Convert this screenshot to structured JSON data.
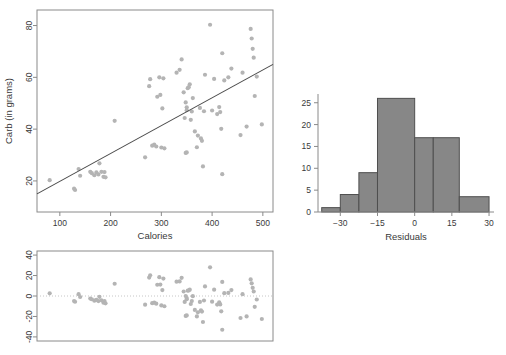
{
  "figure": {
    "name": "regression-diagnostics-figure",
    "panels": [
      "scatter-with-fit",
      "residual-plot",
      "residual-histogram"
    ]
  },
  "chart_data": [
    {
      "id": "scatter",
      "type": "scatter",
      "title": "",
      "xlabel": "Calories",
      "ylabel": "Carb (in grams)",
      "xlim": [
        55,
        520
      ],
      "ylim": [
        8,
        86
      ],
      "xticks": [
        100,
        200,
        300,
        400,
        500
      ],
      "yticks": [
        20,
        40,
        60,
        80
      ],
      "grid": false,
      "legend": "none",
      "fit_line": {
        "label": "least-squares line",
        "x": [
          55,
          520
        ],
        "y": [
          15.0,
          65.0
        ]
      },
      "points": [
        [
          80,
          20.3
        ],
        [
          128,
          17.0
        ],
        [
          130,
          16.5
        ],
        [
          137,
          24.6
        ],
        [
          140,
          22.0
        ],
        [
          160,
          23.5
        ],
        [
          163,
          23.0
        ],
        [
          168,
          22.2
        ],
        [
          172,
          23.3
        ],
        [
          176,
          22.5
        ],
        [
          178,
          26.8
        ],
        [
          182,
          23.5
        ],
        [
          186,
          21.6
        ],
        [
          188,
          23.4
        ],
        [
          190,
          21.4
        ],
        [
          208,
          43.2
        ],
        [
          268,
          29.1
        ],
        [
          276,
          56.6
        ],
        [
          278,
          59.3
        ],
        [
          282,
          33.6
        ],
        [
          286,
          34.0
        ],
        [
          290,
          33.3
        ],
        [
          292,
          52.5
        ],
        [
          296,
          60.0
        ],
        [
          298,
          53.2
        ],
        [
          300,
          32.9
        ],
        [
          302,
          48.0
        ],
        [
          304,
          59.6
        ],
        [
          306,
          32.6
        ],
        [
          330,
          61.8
        ],
        [
          336,
          62.9
        ],
        [
          340,
          66.9
        ],
        [
          344,
          54.2
        ],
        [
          346,
          44.3
        ],
        [
          348,
          50.3
        ],
        [
          348,
          30.8
        ],
        [
          350,
          48.4
        ],
        [
          350,
          47.3
        ],
        [
          350,
          31.0
        ],
        [
          352,
          55.8
        ],
        [
          354,
          56.2
        ],
        [
          356,
          57.3
        ],
        [
          358,
          43.6
        ],
        [
          360,
          46.8
        ],
        [
          362,
          52.0
        ],
        [
          366,
          39.1
        ],
        [
          370,
          33.0
        ],
        [
          372,
          37.5
        ],
        [
          376,
          48.2
        ],
        [
          378,
          36.4
        ],
        [
          380,
          35.5
        ],
        [
          382,
          25.6
        ],
        [
          384,
          46.9
        ],
        [
          386,
          61.0
        ],
        [
          396,
          80.3
        ],
        [
          400,
          47.2
        ],
        [
          404,
          59.4
        ],
        [
          410,
          45.8
        ],
        [
          414,
          48.5
        ],
        [
          416,
          46.6
        ],
        [
          418,
          40.1
        ],
        [
          420,
          69.3
        ],
        [
          420,
          22.6
        ],
        [
          424,
          58.8
        ],
        [
          432,
          60.0
        ],
        [
          438,
          63.4
        ],
        [
          456,
          37.7
        ],
        [
          460,
          61.8
        ],
        [
          468,
          41.0
        ],
        [
          476,
          78.7
        ],
        [
          478,
          75.0
        ],
        [
          480,
          71.0
        ],
        [
          482,
          67.6
        ],
        [
          484,
          52.8
        ],
        [
          488,
          60.3
        ],
        [
          498,
          41.8
        ]
      ]
    },
    {
      "id": "residuals-vs-calories",
      "type": "scatter",
      "title": "",
      "xlabel": "",
      "ylabel": "",
      "xlim": [
        55,
        520
      ],
      "ylim": [
        -44,
        44
      ],
      "xticks": [],
      "yticks": [
        -40,
        -20,
        0,
        20,
        40
      ],
      "grid": false,
      "legend": "none",
      "reference_line": {
        "label": "zero-line",
        "y": 0
      },
      "points": [
        [
          80,
          2.6
        ],
        [
          128,
          -5.0
        ],
        [
          130,
          -5.6
        ],
        [
          137,
          1.8
        ],
        [
          140,
          -1.0
        ],
        [
          160,
          -2.5
        ],
        [
          163,
          -3.2
        ],
        [
          168,
          -4.6
        ],
        [
          172,
          -3.8
        ],
        [
          176,
          -5.0
        ],
        [
          178,
          -0.8
        ],
        [
          182,
          -4.2
        ],
        [
          186,
          -6.6
        ],
        [
          188,
          -5.0
        ],
        [
          190,
          -7.2
        ],
        [
          208,
          12.0
        ],
        [
          268,
          -8.5
        ],
        [
          276,
          18.0
        ],
        [
          278,
          20.3
        ],
        [
          282,
          -7.0
        ],
        [
          286,
          -6.5
        ],
        [
          290,
          -7.5
        ],
        [
          292,
          11.0
        ],
        [
          296,
          18.4
        ],
        [
          298,
          11.2
        ],
        [
          300,
          -9.2
        ],
        [
          302,
          5.8
        ],
        [
          304,
          17.0
        ],
        [
          306,
          -10.0
        ],
        [
          330,
          14.0
        ],
        [
          336,
          14.3
        ],
        [
          340,
          17.8
        ],
        [
          344,
          4.4
        ],
        [
          346,
          -5.8
        ],
        [
          348,
          0.0
        ],
        [
          348,
          -19.5
        ],
        [
          350,
          -2.0
        ],
        [
          350,
          -3.2
        ],
        [
          350,
          -19.0
        ],
        [
          352,
          5.2
        ],
        [
          354,
          5.4
        ],
        [
          356,
          6.2
        ],
        [
          358,
          -7.8
        ],
        [
          360,
          -5.0
        ],
        [
          362,
          -0.2
        ],
        [
          366,
          -13.6
        ],
        [
          370,
          -20.0
        ],
        [
          372,
          -16.0
        ],
        [
          376,
          -5.8
        ],
        [
          378,
          -14.0
        ],
        [
          380,
          -15.2
        ],
        [
          382,
          -25.4
        ],
        [
          384,
          -4.4
        ],
        [
          386,
          9.4
        ],
        [
          396,
          28.0
        ],
        [
          400,
          -5.5
        ],
        [
          404,
          6.2
        ],
        [
          410,
          -8.4
        ],
        [
          414,
          -6.1
        ],
        [
          416,
          -8.2
        ],
        [
          418,
          -15.0
        ],
        [
          420,
          13.8
        ],
        [
          420,
          -33.0
        ],
        [
          424,
          2.8
        ],
        [
          432,
          3.0
        ],
        [
          438,
          5.8
        ],
        [
          456,
          -21.5
        ],
        [
          460,
          1.8
        ],
        [
          468,
          -20.0
        ],
        [
          476,
          16.2
        ],
        [
          478,
          12.4
        ],
        [
          480,
          8.0
        ],
        [
          482,
          4.4
        ],
        [
          484,
          -10.6
        ],
        [
          488,
          -3.4
        ],
        [
          498,
          -22.5
        ]
      ]
    },
    {
      "id": "residual-histogram",
      "type": "bar",
      "title": "",
      "xlabel": "Residuals",
      "ylabel": "",
      "xlim": [
        -39,
        32
      ],
      "ylim": [
        0,
        27
      ],
      "xticks": [
        -30,
        -15,
        0,
        15,
        30
      ],
      "yticks": [
        0,
        5,
        10,
        15,
        20,
        25
      ],
      "grid": false,
      "legend": "none",
      "bin_edges": [
        -37.5,
        -30,
        -22.5,
        -15,
        -7.5,
        0,
        7.5,
        15,
        22.5,
        30
      ],
      "bins": [
        {
          "from": -37.5,
          "to": -30.0,
          "count": 1
        },
        {
          "from": -30.0,
          "to": -22.5,
          "count": 4
        },
        {
          "from": -22.5,
          "to": -15.0,
          "count": 9
        },
        {
          "from": -15.0,
          "to": 0.0,
          "count": 26
        },
        {
          "from": 0.0,
          "to": 7.5,
          "count": 17
        },
        {
          "from": 7.5,
          "to": 18.0,
          "count": 17
        },
        {
          "from": 18.0,
          "to": 30.0,
          "count": 3.5
        }
      ],
      "categories": [
        "-37.5..-30",
        "-30..-22.5",
        "-22.5..-15",
        "-15..0",
        "0..7.5",
        "7.5..18",
        "18..30"
      ],
      "values": [
        1,
        4,
        9,
        26,
        17,
        17,
        3.5
      ]
    }
  ],
  "colors": {
    "point": "#b4b4b4",
    "fit_line": "#4a4a4a",
    "bar_fill": "#878787",
    "bar_edge": "#4f4f4f",
    "axis": "#8a8a8a",
    "text": "#3a3a3a",
    "background": "#ffffff"
  },
  "labels": {
    "scatter_xlabel": "Calories",
    "scatter_ylabel": "Carb (in grams)",
    "hist_xlabel": "Residuals"
  }
}
